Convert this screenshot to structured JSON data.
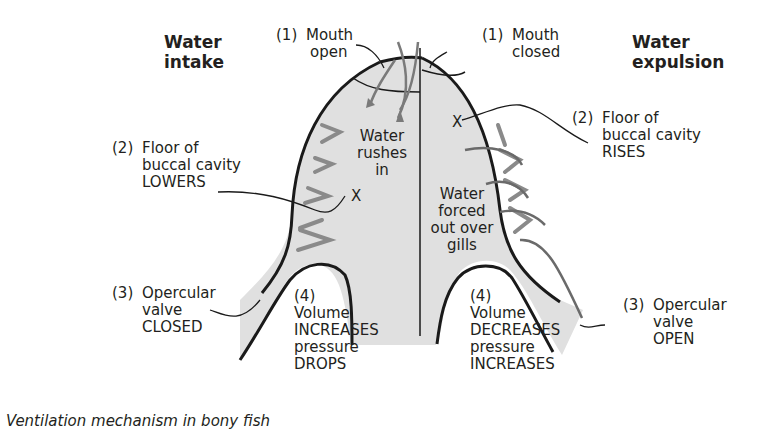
{
  "colors": {
    "outline": "#1a1a1a",
    "fill": "#e0e0e0",
    "arrow": "#8a8a8a",
    "text": "#231f20",
    "background": "#ffffff"
  },
  "intake": {
    "heading": [
      "Water",
      "intake"
    ],
    "mouth": {
      "num": "(1)",
      "lines": [
        "Mouth",
        "open"
      ]
    },
    "floor": {
      "num": "(2)",
      "lines": [
        "Floor of",
        "buccal cavity",
        "LOWERS"
      ]
    },
    "valve": {
      "num": "(3)",
      "lines": [
        "Opercular",
        "valve",
        "CLOSED"
      ]
    },
    "volume": {
      "num": "(4)",
      "lines": [
        "Volume",
        "INCREASES",
        "pressure",
        "DROPS"
      ]
    },
    "inner_text": [
      "Water",
      "rushes",
      "in"
    ],
    "marker": "X"
  },
  "expulsion": {
    "heading": [
      "Water",
      "expulsion"
    ],
    "mouth": {
      "num": "(1)",
      "lines": [
        "Mouth",
        "closed"
      ]
    },
    "floor": {
      "num": "(2)",
      "lines": [
        "Floor of",
        "buccal cavity",
        "RISES"
      ]
    },
    "valve": {
      "num": "(3)",
      "lines": [
        "Opercular",
        "valve",
        "OPEN"
      ]
    },
    "volume": {
      "num": "(4)",
      "lines": [
        "Volume",
        "DECREASES",
        "pressure",
        "INCREASES"
      ]
    },
    "inner_text": [
      "Water",
      "forced",
      "out over",
      "gills"
    ],
    "marker": "X"
  },
  "caption": "Ventilation mechanism in bony fish"
}
